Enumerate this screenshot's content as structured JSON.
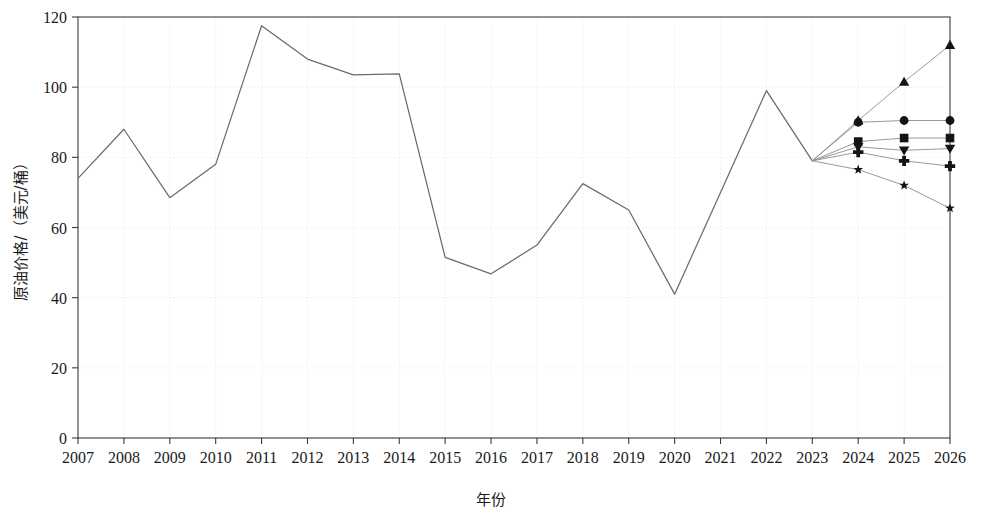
{
  "chart_data": {
    "type": "line",
    "title": "",
    "xlabel": "年份",
    "ylabel": "原油价格/（美元/桶）",
    "xlim": [
      2007,
      2026
    ],
    "ylim": [
      0,
      120
    ],
    "grid": true,
    "legend": "none",
    "x_tick_labels": [
      "2007",
      "2008",
      "2009",
      "2010",
      "2011",
      "2012",
      "2013",
      "2014",
      "2015",
      "2016",
      "2017",
      "2018",
      "2019",
      "2020",
      "2021",
      "2022",
      "2023",
      "2024",
      "2025",
      "2026"
    ],
    "y_tick_labels": [
      "0",
      "20",
      "40",
      "60",
      "80",
      "100",
      "120"
    ],
    "y_ticks": [
      0,
      20,
      40,
      60,
      80,
      100,
      120
    ],
    "series": [
      {
        "name": "历史原油价格",
        "marker": "none",
        "x": [
          2007,
          2008,
          2009,
          2010,
          2011,
          2012,
          2013,
          2014,
          2015,
          2016,
          2017,
          2018,
          2019,
          2020,
          2021,
          2022,
          2023
        ],
        "values": [
          74.0,
          88.0,
          68.5,
          78.0,
          117.5,
          108.0,
          103.5,
          103.8,
          51.5,
          46.8,
          55.0,
          72.5,
          65.0,
          41.0,
          70.0,
          99.0,
          79.0
        ]
      },
      {
        "name": "预测情景1",
        "marker": "triangle-up",
        "x": [
          2023,
          2024,
          2025,
          2026
        ],
        "values": [
          79.0,
          90.5,
          101.5,
          112.0
        ]
      },
      {
        "name": "预测情景2",
        "marker": "circle",
        "x": [
          2023,
          2024,
          2025,
          2026
        ],
        "values": [
          79.0,
          90.0,
          90.5,
          90.5
        ]
      },
      {
        "name": "预测情景3",
        "marker": "square",
        "x": [
          2023,
          2024,
          2025,
          2026
        ],
        "values": [
          79.0,
          84.5,
          85.5,
          85.5
        ]
      },
      {
        "name": "预测情景4",
        "marker": "triangle-down",
        "x": [
          2023,
          2024,
          2025,
          2026
        ],
        "values": [
          79.0,
          83.0,
          82.0,
          82.5
        ]
      },
      {
        "name": "预测情景5",
        "marker": "plus",
        "x": [
          2023,
          2024,
          2025,
          2026
        ],
        "values": [
          79.0,
          81.5,
          79.0,
          77.5
        ]
      },
      {
        "name": "预测情景6",
        "marker": "star",
        "x": [
          2023,
          2024,
          2025,
          2026
        ],
        "values": [
          79.0,
          76.5,
          72.0,
          65.5
        ]
      }
    ]
  },
  "axes": {
    "x_label": "年份",
    "y_label": "原油价格/（美元/桶）"
  },
  "colors": {
    "line": "#6b6b6b",
    "forecast_line": "#8e8e8e",
    "marker": "#141414",
    "axis": "#3a3a3a",
    "grid": "#d8d8d8",
    "background": "#ffffff"
  }
}
